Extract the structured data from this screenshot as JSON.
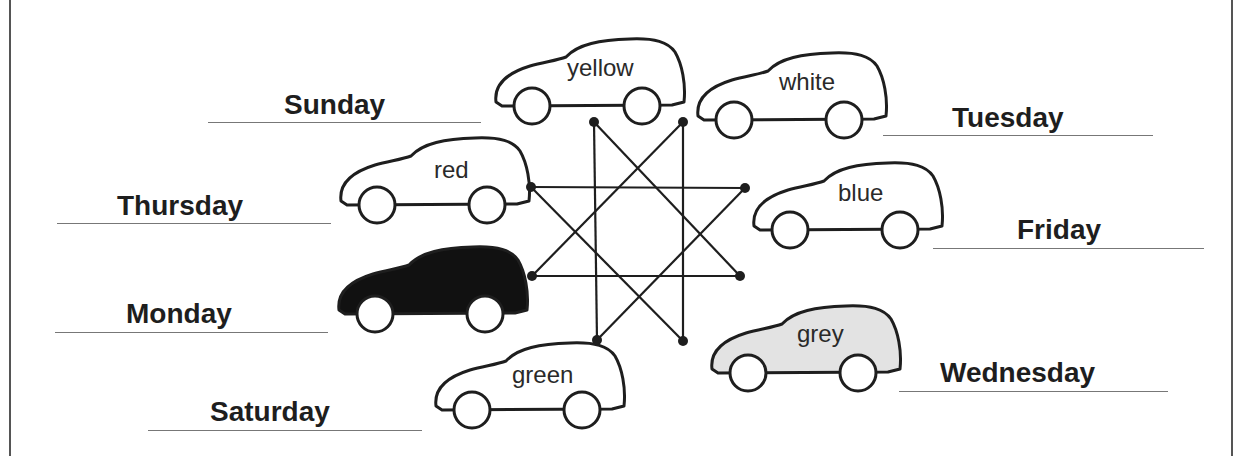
{
  "worksheet": {
    "days": [
      {
        "label": "Sunday",
        "x": 284,
        "y": 91,
        "line": [
          208,
          481,
          122
        ]
      },
      {
        "label": "Thursday",
        "x": 117,
        "y": 192,
        "line": [
          57,
          331,
          223
        ]
      },
      {
        "label": "Monday",
        "x": 126,
        "y": 300,
        "line": [
          55,
          328,
          332
        ]
      },
      {
        "label": "Saturday",
        "x": 210,
        "y": 398,
        "line": [
          148,
          422,
          430
        ]
      },
      {
        "label": "Tuesday",
        "x": 952,
        "y": 104,
        "line": [
          883,
          1153,
          135
        ]
      },
      {
        "label": "Friday",
        "x": 1017,
        "y": 216,
        "line": [
          933,
          1204,
          248
        ]
      },
      {
        "label": "Wednesday",
        "x": 940,
        "y": 359,
        "line": [
          899,
          1168,
          391
        ]
      }
    ],
    "cars": [
      {
        "label": "yellow",
        "x": 490,
        "y": 36,
        "fill": "#ffffff",
        "tx": 567,
        "ty": 56
      },
      {
        "label": "white",
        "x": 692,
        "y": 50,
        "fill": "#ffffff",
        "tx": 779,
        "ty": 70
      },
      {
        "label": "red",
        "x": 335,
        "y": 135,
        "fill": "#ffffff",
        "tx": 434,
        "ty": 158
      },
      {
        "label": "blue",
        "x": 748,
        "y": 160,
        "fill": "#ffffff",
        "tx": 838,
        "ty": 181
      },
      {
        "label": "",
        "x": 333,
        "y": 244,
        "fill": "#111111",
        "tx": 0,
        "ty": 0
      },
      {
        "label": "grey",
        "x": 706,
        "y": 303,
        "fill": "#e3e3e3",
        "tx": 797,
        "ty": 322
      },
      {
        "label": "green",
        "x": 430,
        "y": 340,
        "fill": "#ffffff",
        "tx": 512,
        "ty": 363
      }
    ],
    "star_dots": [
      [
        594,
        122
      ],
      [
        683,
        122
      ],
      [
        531,
        187
      ],
      [
        745,
        188
      ],
      [
        532,
        276
      ],
      [
        740,
        276
      ],
      [
        597,
        340
      ],
      [
        683,
        341
      ]
    ],
    "star_lines": [
      [
        0,
        6
      ],
      [
        1,
        7
      ],
      [
        2,
        3
      ],
      [
        4,
        5
      ],
      [
        2,
        7
      ],
      [
        3,
        6
      ],
      [
        4,
        1
      ],
      [
        5,
        0
      ]
    ],
    "colors": {
      "ink": "#1e1e1e",
      "rule": "#777777",
      "frame": "#555555"
    }
  }
}
